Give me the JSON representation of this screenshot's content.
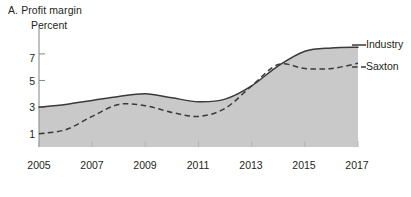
{
  "chart_data": {
    "type": "line",
    "title": "A. Profit margin",
    "ylabel": "Percent",
    "xlabel": "",
    "ylim": [
      0,
      8.2
    ],
    "xlim": [
      2005,
      2017
    ],
    "yticks": [
      1,
      3,
      5,
      7
    ],
    "xticks": [
      2005,
      2007,
      2009,
      2011,
      2013,
      2015,
      2017
    ],
    "grid": false,
    "legend_position": "right",
    "area_fill": true,
    "fill_color": "#c9c9c9",
    "line_color": "#3a3a3a",
    "x": [
      2005,
      2006,
      2007,
      2008,
      2009,
      2010,
      2011,
      2012,
      2013,
      2014,
      2015,
      2016,
      2017
    ],
    "series": [
      {
        "name": "Industry",
        "style": "solid",
        "values": [
          3.0,
          3.2,
          3.5,
          3.8,
          4.0,
          3.7,
          3.4,
          3.6,
          4.6,
          6.1,
          7.2,
          7.45,
          7.5
        ]
      },
      {
        "name": "Saxton",
        "style": "dashed",
        "values": [
          1.0,
          1.3,
          2.3,
          3.2,
          3.1,
          2.6,
          2.3,
          2.9,
          4.6,
          6.2,
          5.9,
          5.9,
          6.3
        ]
      }
    ]
  },
  "labels": {
    "title": "A. Profit margin",
    "unit": "Percent",
    "y": [
      "7",
      "5",
      "3",
      "1"
    ],
    "x": [
      "2005",
      "2007",
      "2009",
      "2011",
      "2013",
      "2015",
      "2017"
    ],
    "legend": [
      "Industry",
      "Saxton"
    ]
  }
}
